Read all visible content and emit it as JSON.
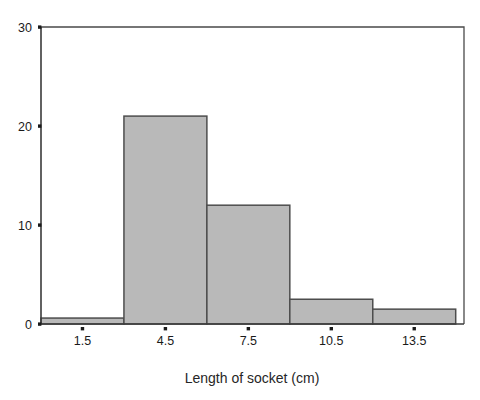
{
  "chart_data": {
    "type": "bar",
    "title": "",
    "subtitle": "",
    "xlabel": "Length of socket (cm)",
    "ylabel": "",
    "xlim": [
      0,
      15.3
    ],
    "ylim": [
      0,
      30
    ],
    "grid": false,
    "legend": null,
    "bar_fill_color": "#b9b9b9",
    "bar_edge_color": "#4d4d4d",
    "axis_color": "#3a3a3a",
    "background_color": "#ffffff",
    "x_tick_labels": [
      "1.5",
      "4.5",
      "7.5",
      "10.5",
      "13.5"
    ],
    "x_tick_values": [
      1.5,
      4.5,
      7.5,
      10.5,
      13.5
    ],
    "y_tick_labels": [
      "0",
      "10",
      "20",
      "30"
    ],
    "y_tick_values": [
      0,
      10,
      20,
      30
    ],
    "bin_edges": [
      0,
      3,
      6,
      9,
      12,
      15
    ],
    "categories": [
      "0-3",
      "3-6",
      "6-9",
      "9-12",
      "12-15"
    ],
    "values": [
      0.6,
      21,
      12,
      2.5,
      1.5
    ],
    "bars": [
      {
        "label": "0-3",
        "x0": 0,
        "x1": 3,
        "value": 0.6
      },
      {
        "label": "3-6",
        "x0": 3,
        "x1": 6,
        "value": 21
      },
      {
        "label": "6-9",
        "x0": 6,
        "x1": 9,
        "value": 12
      },
      {
        "label": "9-12",
        "x0": 9,
        "x1": 12,
        "value": 2.5
      },
      {
        "label": "12-15",
        "x0": 12,
        "x1": 15,
        "value": 1.5
      }
    ]
  }
}
